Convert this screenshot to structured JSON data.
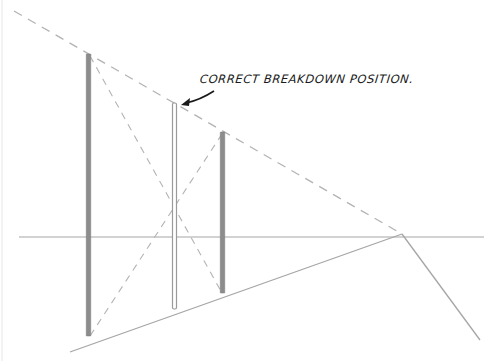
{
  "diagram": {
    "annotation": "CORRECT BREAKDOWN POSITION.",
    "colors": {
      "background": "#ffffff",
      "line": "#a6a6a6",
      "dashed": "#b3b3b3",
      "pole_dark": "#8c8c8c",
      "pole_light_fill": "#ffffff",
      "pole_light_stroke": "#9a9a9a",
      "text": "#1a1a1a"
    },
    "elements": {
      "horizon_line": {
        "x1": 19,
        "y1": 237,
        "x2": 484,
        "y2": 237
      },
      "vanishing_point": {
        "x": 402,
        "y": 234
      },
      "top_dashed_line": {
        "x1": 14,
        "y1": 11,
        "x2": 402,
        "y2": 234
      },
      "ground_line": {
        "x1": 70,
        "y1": 352,
        "x2": 402,
        "y2": 234
      },
      "right_diagonal": {
        "x1": 402,
        "y1": 234,
        "x2": 480,
        "y2": 340
      },
      "poles": [
        {
          "name": "near-pole",
          "x": 88.5,
          "top": 54,
          "bottom": 336,
          "style": "dark"
        },
        {
          "name": "breakdown-pole",
          "x": 174.5,
          "top": 103,
          "bottom": 309,
          "style": "light"
        },
        {
          "name": "far-pole",
          "x": 222.5,
          "top": 132,
          "bottom": 293,
          "style": "dark"
        }
      ],
      "cross_diagonals": [
        {
          "x1": 90,
          "y1": 56,
          "x2": 222,
          "y2": 293
        },
        {
          "x1": 222,
          "y1": 134,
          "x2": 90,
          "y2": 336
        }
      ],
      "arrow": {
        "from": [
          214,
          91
        ],
        "to": [
          183,
          104
        ]
      }
    }
  }
}
